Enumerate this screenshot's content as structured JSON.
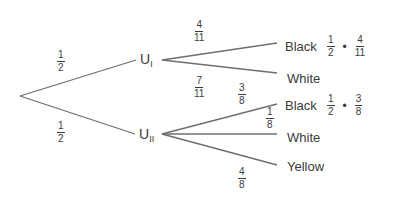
{
  "diagram": {
    "type": "probability-tree",
    "line_color": "#6e6e6e",
    "root_branches": [
      {
        "num": "1",
        "den": "2",
        "target": "U_I"
      },
      {
        "num": "1",
        "den": "2",
        "target": "U_II"
      }
    ],
    "nodes": {
      "u1": {
        "label": "U",
        "sub": "I"
      },
      "u2": {
        "label": "U",
        "sub": "II"
      }
    },
    "u1_branches": [
      {
        "outcome": "Black",
        "num": "4",
        "den": "11"
      },
      {
        "outcome": "White",
        "num": "7",
        "den": "11"
      }
    ],
    "u2_branches": [
      {
        "outcome": "Black",
        "num": "3",
        "den": "8"
      },
      {
        "outcome": "White",
        "num": "1",
        "den": "8"
      },
      {
        "outcome": "Yellow",
        "num": "4",
        "den": "8"
      }
    ],
    "products": [
      {
        "outcome": "Black (U_I)",
        "a_num": "1",
        "a_den": "2",
        "op": "•",
        "b_num": "4",
        "b_den": "11"
      },
      {
        "outcome": "Black (U_II)",
        "a_num": "1",
        "a_den": "2",
        "op": "•",
        "b_num": "3",
        "b_den": "8"
      }
    ]
  }
}
